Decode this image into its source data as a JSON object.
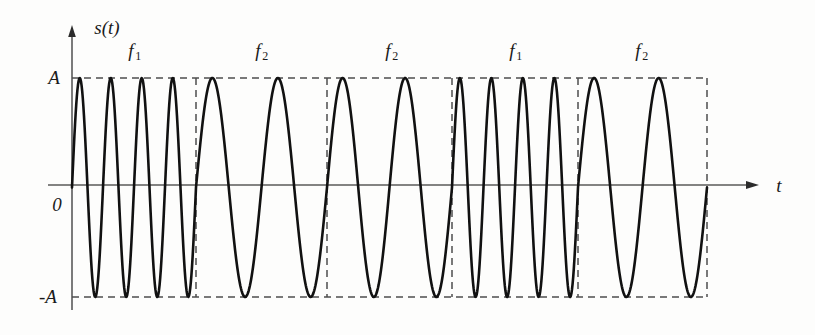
{
  "figure": {
    "kind": "fsk-waveform-diagram",
    "background_color": "#fdfdfc",
    "curve_color": "#111111",
    "axis_color": "#5a5a5a",
    "dashed_color": "#4d4d4d",
    "y_axis_label": "s(t)",
    "x_axis_label": "t",
    "origin_label": "0",
    "top_level_label": "A",
    "bottom_level_label": "-A"
  },
  "segment_labels": [
    {
      "text": "f",
      "sub": "1",
      "cx": 135,
      "cy": 52
    },
    {
      "text": "f",
      "sub": "2",
      "cx": 262,
      "cy": 52
    },
    {
      "text": "f",
      "sub": "2",
      "cx": 392,
      "cy": 52
    },
    {
      "text": "f",
      "sub": "1",
      "cx": 516,
      "cy": 52
    },
    {
      "text": "f",
      "sub": "2",
      "cx": 642,
      "cy": 52
    }
  ],
  "chart_data": {
    "type": "line",
    "title": "",
    "xlabel": "t",
    "ylabel": "s(t)",
    "ylim": [
      -1,
      1
    ],
    "ytick_labels": [
      "A",
      "0",
      "-A"
    ],
    "ytick_values": [
      1,
      0,
      -1
    ],
    "grid": false,
    "legend": "none",
    "amplitude": 1,
    "geometry": {
      "y_axis_x": 72,
      "y_axis_top": 27,
      "y_axis_bottom": 310,
      "baseline_y": 185,
      "level_A_y": 78,
      "level_negA_y": 297,
      "x_axis_arrow_x": 757,
      "x_label_x": 779,
      "envelope_right_x": 707
    },
    "series": [
      {
        "name": "s(t)",
        "segments": [
          {
            "label": "f1",
            "frequency": "f1",
            "x_start": 72,
            "x_end": 196,
            "cycles": 4,
            "period_px": 31
          },
          {
            "label": "f2",
            "frequency": "f2",
            "x_start": 196,
            "x_end": 327,
            "cycles": 2,
            "period_px": 65.5
          },
          {
            "label": "f2",
            "frequency": "f2",
            "x_start": 327,
            "x_end": 452,
            "cycles": 2,
            "period_px": 62.5
          },
          {
            "label": "f1",
            "frequency": "f1",
            "x_start": 452,
            "x_end": 578,
            "cycles": 4,
            "period_px": 31.5
          },
          {
            "label": "f2",
            "frequency": "f2",
            "x_start": 578,
            "x_end": 707,
            "cycles": 2,
            "period_px": 64.5
          }
        ]
      }
    ],
    "envelope_boundaries_px": [
      72,
      196,
      327,
      452,
      578,
      707
    ]
  }
}
